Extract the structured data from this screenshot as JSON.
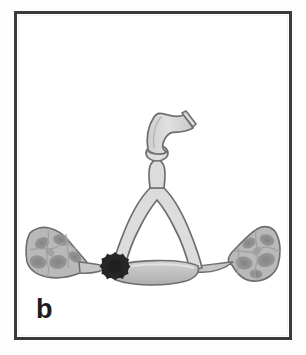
{
  "figure": {
    "panel_label": "b",
    "caption_present": false,
    "type": "scientific-line-illustration",
    "background_color": "#fdfdfd",
    "frame": {
      "border_color": "#3a3a3a",
      "border_width_px": 3,
      "inner_fill": "#ffffff",
      "x": 14,
      "y": 11,
      "width": 278,
      "height": 329
    },
    "colors": {
      "outline": "#6e6e6e",
      "tissue_fill": "#d8d8d8",
      "tissue_fill_mid": "#c6c6c6",
      "cell_mass_fill": "#b9b9b9",
      "nucleus_fill": "#8f8f8f",
      "nucleus_fill_dark": "#848484",
      "star_fill": "#262626",
      "label_color": "#1c1c1c",
      "duct_bar_fill": "#c0c0c0"
    },
    "elements": [
      {
        "name": "upper-curved-tube",
        "label": "curved tubular process with flared distal end"
      },
      {
        "name": "tube-joint",
        "label": "constricted joint / isthmus"
      },
      {
        "name": "vertical-stalk",
        "label": "vertical stalk"
      },
      {
        "name": "arch-duct",
        "label": "inverted U-shaped arch duct"
      },
      {
        "name": "horizontal-bar",
        "label": "lens-shaped basal bar"
      },
      {
        "name": "left-cell-mass",
        "label": "left stippled cellular mass"
      },
      {
        "name": "right-cell-mass",
        "label": "right stippled cellular mass"
      },
      {
        "name": "left-connecting-strand",
        "label": "left tapering connecting strand"
      },
      {
        "name": "right-connecting-strand",
        "label": "right tapering connecting strand"
      },
      {
        "name": "dark-star-deposit",
        "label": "dark star-shaped deposit"
      }
    ]
  }
}
